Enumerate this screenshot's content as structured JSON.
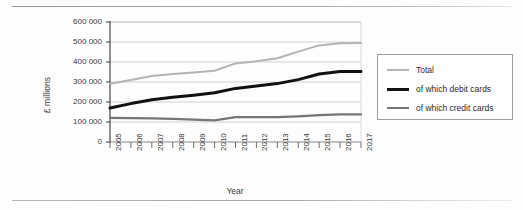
{
  "chart_data": {
    "type": "line",
    "title": "",
    "xlabel": "Year",
    "ylabel": "£ millions",
    "x": [
      2005,
      2006,
      2007,
      2008,
      2009,
      2010,
      2011,
      2012,
      2013,
      2014,
      2015,
      2016,
      2017
    ],
    "categories": [
      "2005",
      "2006",
      "2007",
      "2008",
      "2009",
      "2010",
      "2011",
      "2012",
      "2013",
      "2014",
      "2015",
      "2016",
      "2017"
    ],
    "ylim": [
      0,
      600000
    ],
    "yticks": [
      0,
      100000,
      200000,
      300000,
      400000,
      500000,
      600000
    ],
    "ytick_labels": [
      "0",
      "100 000",
      "200 000",
      "300 000",
      "400 000",
      "500 000",
      "600 000"
    ],
    "grid": true,
    "legend_position": "right",
    "series": [
      {
        "name": "Total",
        "color": "#b4b4b4",
        "width": 2.0,
        "values": [
          291000,
          310000,
          330000,
          340000,
          348000,
          356000,
          393000,
          404000,
          419000,
          452000,
          483000,
          494000,
          495000
        ]
      },
      {
        "name": "of which debit cards",
        "color": "#111111",
        "width": 3.0,
        "values": [
          170000,
          192000,
          211000,
          224000,
          234000,
          246000,
          268000,
          280000,
          292000,
          312000,
          340000,
          352000,
          353000
        ]
      },
      {
        "name": "of which credit cards",
        "color": "#767676",
        "width": 2.2,
        "values": [
          121000,
          119000,
          118000,
          116000,
          112000,
          108000,
          124000,
          124000,
          124000,
          128000,
          134000,
          138000,
          138000
        ]
      }
    ]
  },
  "legend": {
    "entries": [
      {
        "label": "Total"
      },
      {
        "label": "of which debit cards"
      },
      {
        "label": "of which credit cards"
      }
    ]
  },
  "axes": {
    "y_title": "£ millions",
    "x_title": "Year"
  }
}
